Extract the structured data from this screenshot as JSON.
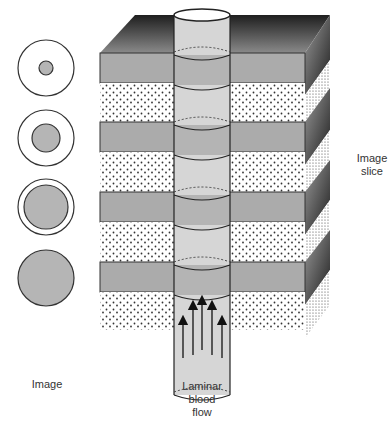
{
  "figure": {
    "labels": {
      "image": "Image",
      "image_slice_line1": "Image",
      "image_slice_line2": "slice",
      "flow_line1": "Laminar",
      "flow_line2": "blood",
      "flow_line3": "flow"
    },
    "colors": {
      "gray_band": "#ababab",
      "tube": "#d6d6d6",
      "tube_band": "#b4b4b4",
      "outline": "#2a2a2a",
      "circle_fill": "#b5b5b5"
    },
    "image_circles": [
      {
        "outer_r": 28,
        "inner_r": 7
      },
      {
        "outer_r": 28,
        "inner_r": 14
      },
      {
        "outer_r": 28,
        "inner_r": 22
      },
      {
        "outer_r": 28,
        "inner_r": 28
      }
    ]
  }
}
